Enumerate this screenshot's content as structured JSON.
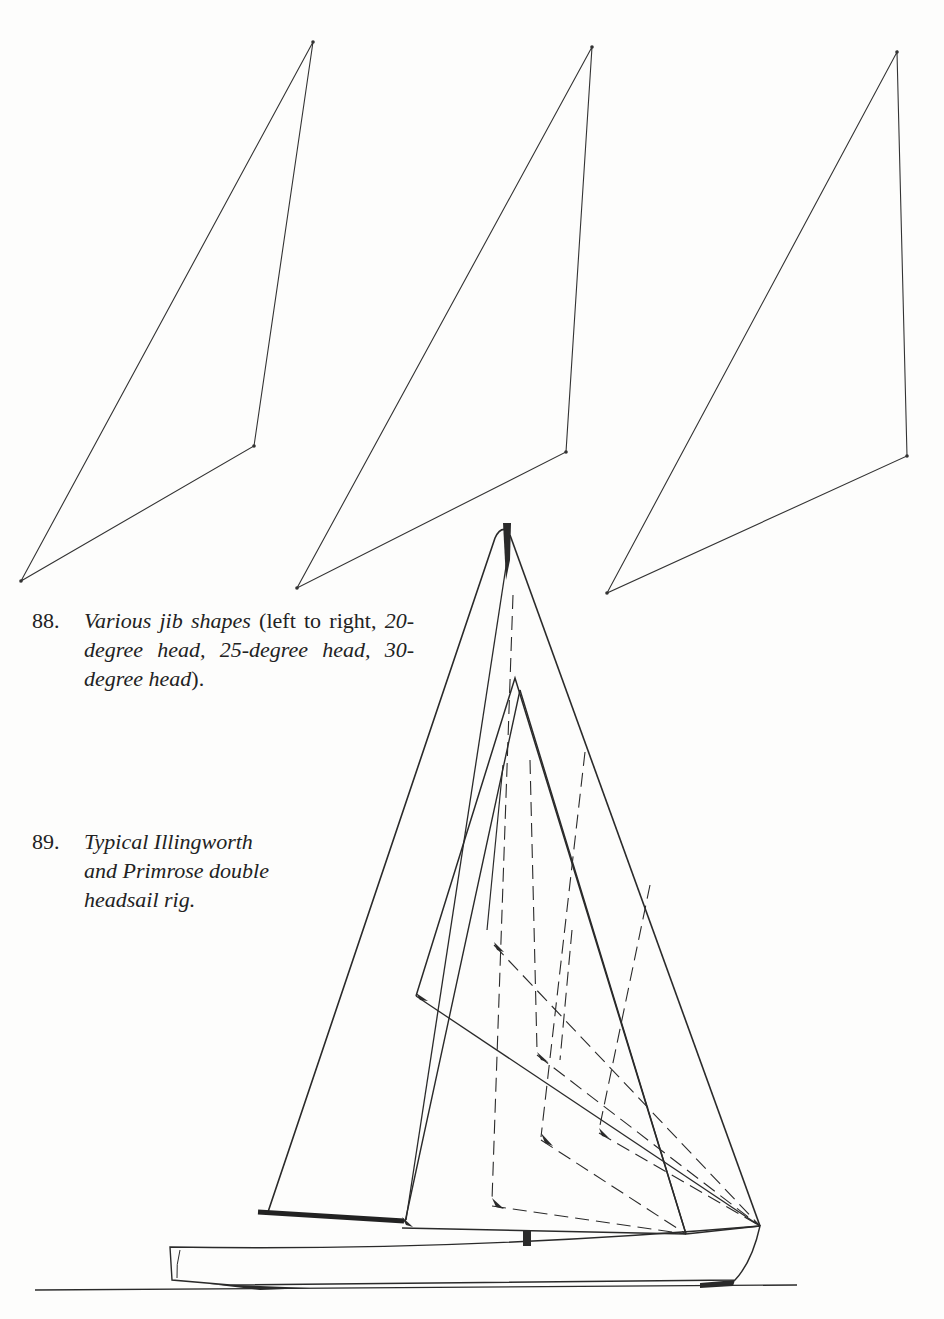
{
  "figure_88": {
    "number": "88.",
    "title": "Various jib shapes",
    "text_a": " (left to right, ",
    "head_20": "20-degree head,",
    "head_25": "25-degree head,",
    "head_30": "30-degree head",
    "text_end": ").",
    "jibs": [
      {
        "label": "20-degree head",
        "head": [
          313,
          42
        ],
        "clew": [
          254,
          446
        ],
        "tack": [
          21,
          581
        ]
      },
      {
        "label": "25-degree head",
        "head": [
          592,
          47
        ],
        "clew": [
          566,
          452
        ],
        "tack": [
          297,
          588
        ]
      },
      {
        "label": "30-degree head",
        "head": [
          897,
          52
        ],
        "clew": [
          907,
          456
        ],
        "tack": [
          607,
          593
        ]
      }
    ]
  },
  "figure_89": {
    "number": "89.",
    "line1": "Typical Illingworth",
    "line2": "and Primrose double",
    "line3": "headsail rig.",
    "drawing": "sailboat-double-headsail-rig"
  }
}
